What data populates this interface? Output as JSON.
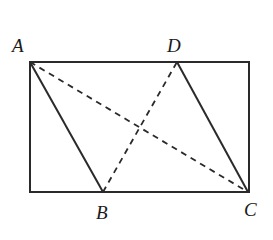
{
  "diagram": {
    "type": "geometry",
    "colors": {
      "stroke": "#2a2a2a",
      "background": "#ffffff"
    },
    "points": {
      "A": {
        "label": "A",
        "x": 30,
        "y": 62
      },
      "B": {
        "label": "B",
        "x": 103,
        "y": 192
      },
      "C": {
        "label": "C",
        "x": 248,
        "y": 192
      },
      "D": {
        "label": "D",
        "x": 177,
        "y": 62
      }
    },
    "rectangle": {
      "x1": 30,
      "y1": 62,
      "x2": 249,
      "y2": 192
    },
    "solid_segments": [
      "AB",
      "DC"
    ],
    "dashed_segments": [
      "AC",
      "BD"
    ],
    "labels": {
      "A": "A",
      "B": "B",
      "C": "C",
      "D": "D"
    }
  }
}
